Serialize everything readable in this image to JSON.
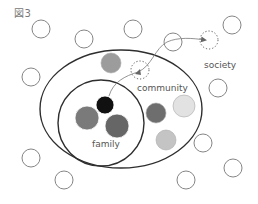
{
  "figure": {
    "title": "図3",
    "labels": {
      "community": "community",
      "family": "family",
      "society": "society"
    },
    "colors": {
      "stroke": "#555555",
      "ellipse_stroke": "#2e2e2e",
      "black": "#111111",
      "mid_gray": "#7a7a7a",
      "dark_gray": "#666666",
      "gray": "#9c9c9c",
      "light_gray": "#c4c4c4",
      "lightest_gray": "#e2e2e2"
    },
    "society_circles": [
      {
        "cx": 41,
        "cy": 29,
        "r": 9
      },
      {
        "cx": 84,
        "cy": 39,
        "r": 9
      },
      {
        "cx": 133,
        "cy": 29,
        "r": 9
      },
      {
        "cx": 173,
        "cy": 42,
        "r": 9
      },
      {
        "cx": 232,
        "cy": 25,
        "r": 9
      },
      {
        "cx": 31,
        "cy": 77,
        "r": 9
      },
      {
        "cx": 218,
        "cy": 88,
        "r": 9
      },
      {
        "cx": 203,
        "cy": 143,
        "r": 9
      },
      {
        "cx": 31,
        "cy": 158,
        "r": 9
      },
      {
        "cx": 64,
        "cy": 180,
        "r": 9
      },
      {
        "cx": 186,
        "cy": 180,
        "r": 9
      },
      {
        "cx": 233,
        "cy": 168,
        "r": 9
      }
    ],
    "dotted_circles": [
      {
        "cx": 140,
        "cy": 70,
        "r": 9
      },
      {
        "cx": 209,
        "cy": 40,
        "r": 9
      }
    ],
    "community_ellipse": {
      "cx": 121,
      "cy": 109,
      "rx": 81,
      "ry": 59
    },
    "family_circle": {
      "cx": 101,
      "cy": 123,
      "r": 43
    },
    "family_members": [
      {
        "cx": 105,
        "cy": 105,
        "r": 9,
        "fill": "#111111"
      },
      {
        "cx": 87,
        "cy": 118,
        "r": 12,
        "fill": "#7a7a7a"
      },
      {
        "cx": 117,
        "cy": 126,
        "r": 12,
        "fill": "#666666"
      }
    ],
    "community_members": [
      {
        "cx": 111,
        "cy": 63,
        "r": 10,
        "fill": "#9c9c9c"
      },
      {
        "cx": 156,
        "cy": 113,
        "r": 10,
        "fill": "#6e6e6e"
      },
      {
        "cx": 184,
        "cy": 106,
        "r": 11,
        "fill": "#e2e2e2"
      },
      {
        "cx": 166,
        "cy": 140,
        "r": 10,
        "fill": "#c4c4c4"
      }
    ],
    "arrow_path": "M 109 96 C 113 82, 125 76, 138 72 C 152 66, 155 48, 167 42 C 178 37, 192 38, 205 40"
  }
}
